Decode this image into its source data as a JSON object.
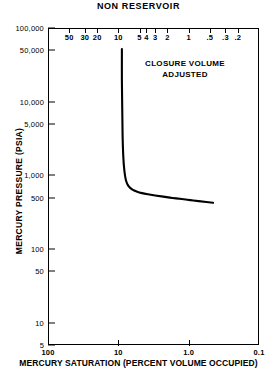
{
  "chart_data": {
    "type": "line",
    "title": "NON RESERVOIR",
    "xlabel": "MERCURY SATURATION (PERCENT VOLUME OCCUPIED)",
    "ylabel": "MERCURY PRESSURE (PSIA)",
    "xscale": "log",
    "yscale": "log",
    "x_reversed": true,
    "xlim": [
      100,
      0.1
    ],
    "ylim": [
      5,
      100000
    ],
    "grid": false,
    "legend": null,
    "annotations": [
      {
        "text_line1": "CLOSURE VOLUME",
        "text_line2": "ADJUSTED",
        "x": 1.9,
        "y": 22000
      }
    ],
    "x_bottom_ticks": [
      "100",
      "10",
      "1.0",
      "0.1"
    ],
    "x_bottom_tick_values": [
      100,
      10,
      1.0,
      0.1
    ],
    "x_top_ticks": [
      "50",
      "30",
      "20",
      "10",
      "5",
      "4",
      "3",
      "2",
      "1",
      ".5",
      ".3",
      ".2"
    ],
    "x_top_tick_values": [
      50,
      30,
      20,
      10,
      5,
      4,
      3,
      2,
      1,
      0.5,
      0.3,
      0.2
    ],
    "y_ticks": [
      "100,000",
      "50,000",
      "10,000",
      "5,000",
      "1,000",
      "500",
      "100",
      "50",
      "10",
      "5"
    ],
    "y_tick_values": [
      100000,
      50000,
      10000,
      5000,
      1000,
      500,
      100,
      50,
      10,
      5
    ],
    "series": [
      {
        "name": "mercury injection capillary pressure",
        "x": [
          8.9,
          8.9,
          8.8,
          8.7,
          8.5,
          8.2,
          7.8,
          7.2,
          6.3,
          5.4,
          4.6,
          3.8,
          3.0,
          2.3,
          1.7,
          1.25,
          0.95,
          0.72,
          0.56,
          0.45
        ],
        "y": [
          52000,
          20000,
          8000,
          3500,
          1800,
          1150,
          860,
          720,
          640,
          600,
          575,
          555,
          535,
          515,
          495,
          478,
          462,
          448,
          436,
          425
        ]
      }
    ]
  }
}
